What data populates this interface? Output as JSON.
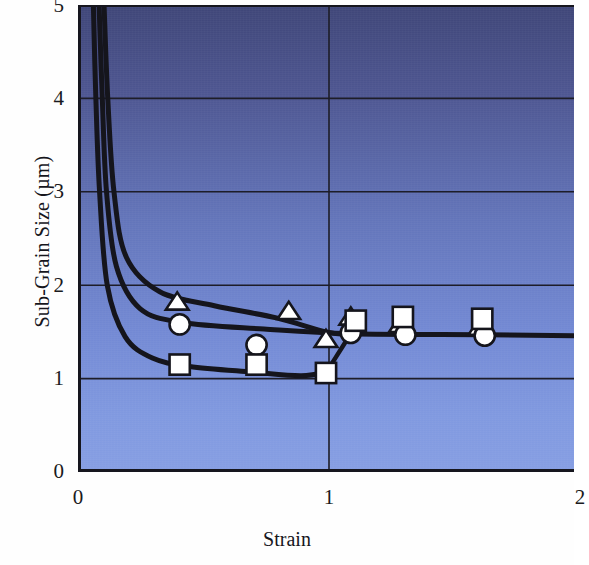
{
  "chart_data": {
    "type": "scatter",
    "title": "",
    "xlabel": "Strain",
    "ylabel": "Sub-Grain Size (µm)",
    "xlim": [
      0,
      2
    ],
    "ylim": [
      0,
      5
    ],
    "xticks": [
      "0",
      "1",
      "2"
    ],
    "xtick_values": [
      0,
      1,
      2
    ],
    "yticks": [
      "0",
      "1",
      "2",
      "3",
      "4",
      "5"
    ],
    "ytick_values": [
      0,
      1,
      2,
      3,
      4,
      5
    ],
    "grid": true,
    "legend": "none",
    "background": "blue vertical gradient, dark navy at top to light periwinkle at bottom",
    "colors": {
      "gradient_top": "#3f4678",
      "gradient_mid": "#6375ba",
      "gradient_bottom": "#869ee3",
      "line": "#15151c",
      "marker_fill": "#ffffff",
      "marker_edge": "#15151c",
      "axis": "#16161e",
      "text": "#1a1a20"
    },
    "series": [
      {
        "name": "triangle",
        "marker": "triangle",
        "points": [
          {
            "x": 0.4,
            "y": 1.82
          },
          {
            "x": 0.85,
            "y": 1.72
          },
          {
            "x": 1.0,
            "y": 1.42
          },
          {
            "x": 1.1,
            "y": 1.66
          },
          {
            "x": 1.3,
            "y": 1.58
          },
          {
            "x": 1.62,
            "y": 1.55
          }
        ]
      },
      {
        "name": "circle",
        "marker": "circle",
        "points": [
          {
            "x": 0.41,
            "y": 1.58
          },
          {
            "x": 0.72,
            "y": 1.36
          },
          {
            "x": 1.1,
            "y": 1.49
          },
          {
            "x": 1.32,
            "y": 1.47
          },
          {
            "x": 1.64,
            "y": 1.46
          }
        ]
      },
      {
        "name": "square",
        "marker": "square",
        "points": [
          {
            "x": 0.41,
            "y": 1.15
          },
          {
            "x": 0.72,
            "y": 1.15
          },
          {
            "x": 1.0,
            "y": 1.06
          },
          {
            "x": 1.12,
            "y": 1.62
          },
          {
            "x": 1.31,
            "y": 1.66
          },
          {
            "x": 1.63,
            "y": 1.64
          }
        ]
      }
    ],
    "curves": [
      {
        "name": "upper-fit-curve",
        "description": "steep decay from top, flattens near 1.6 then merges to plateau 1.47",
        "path": [
          {
            "x": 0.105,
            "y": 5.0
          },
          {
            "x": 0.12,
            "y": 4.0
          },
          {
            "x": 0.145,
            "y": 3.0
          },
          {
            "x": 0.195,
            "y": 2.3
          },
          {
            "x": 0.33,
            "y": 1.93
          },
          {
            "x": 0.55,
            "y": 1.78
          },
          {
            "x": 0.8,
            "y": 1.65
          },
          {
            "x": 1.0,
            "y": 1.5
          },
          {
            "x": 1.1,
            "y": 1.47
          }
        ]
      },
      {
        "name": "middle-fit-curve",
        "description": "steep decay, plateau near 1.55 from strain 0.4 onward",
        "path": [
          {
            "x": 0.085,
            "y": 5.0
          },
          {
            "x": 0.098,
            "y": 4.0
          },
          {
            "x": 0.115,
            "y": 3.0
          },
          {
            "x": 0.155,
            "y": 2.2
          },
          {
            "x": 0.25,
            "y": 1.75
          },
          {
            "x": 0.42,
            "y": 1.6
          },
          {
            "x": 0.75,
            "y": 1.53
          },
          {
            "x": 1.1,
            "y": 1.48
          },
          {
            "x": 1.65,
            "y": 1.47
          },
          {
            "x": 2.0,
            "y": 1.46
          }
        ]
      },
      {
        "name": "lower-fit-curve",
        "description": "steep decay to minimum ~1.03 near strain 0.9 then rises to join plateau",
        "path": [
          {
            "x": 0.062,
            "y": 5.0
          },
          {
            "x": 0.072,
            "y": 4.0
          },
          {
            "x": 0.087,
            "y": 3.0
          },
          {
            "x": 0.118,
            "y": 2.0
          },
          {
            "x": 0.19,
            "y": 1.45
          },
          {
            "x": 0.3,
            "y": 1.22
          },
          {
            "x": 0.45,
            "y": 1.13
          },
          {
            "x": 0.7,
            "y": 1.07
          },
          {
            "x": 0.9,
            "y": 1.03
          },
          {
            "x": 1.02,
            "y": 1.08
          }
        ]
      },
      {
        "name": "rising-tail-segment",
        "description": "short straight rise from the lower curve minimum up toward the plateau",
        "path": [
          {
            "x": 0.99,
            "y": 1.02
          },
          {
            "x": 1.09,
            "y": 1.44
          }
        ]
      }
    ]
  },
  "axes": {
    "xlabel": "Strain",
    "ylabel": "Sub-Grain Size (µm)",
    "ytick_labels": [
      "5",
      "4",
      "3",
      "2",
      "1",
      "0"
    ],
    "xtick_labels": [
      "0",
      "1",
      "2"
    ]
  }
}
